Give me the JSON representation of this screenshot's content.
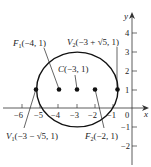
{
  "figure": {
    "axes": {
      "x_label": "x",
      "y_label": "y",
      "x_ticks": [
        "−6",
        "−5",
        "−4",
        "−3",
        "−2",
        "−1",
        "0"
      ],
      "y_ticks": [
        "4",
        "3",
        "2",
        "1",
        "−1",
        "−2"
      ]
    },
    "points": {
      "F1": {
        "name": "F",
        "sub": "1",
        "coords": "(−4, 1)"
      },
      "C": {
        "name": "C",
        "coords": "(−3, 1)"
      },
      "F2": {
        "name": "F",
        "sub": "2",
        "coords": "(−2, 1)"
      },
      "V1": {
        "name": "V",
        "sub": "1",
        "coords": "(−3 − √5, 1)"
      },
      "V2": {
        "name": "V",
        "sub": "2",
        "coords": "(−3 + √5, 1)"
      }
    },
    "ellipse": {
      "center": [
        -3,
        1
      ],
      "a": 2.236,
      "b": 2,
      "equation_hint": "(x+3)²/5 + (y−1)²/4 = 1"
    },
    "colors": {
      "stroke": "#111111",
      "text": "#222222",
      "background": "#ffffff"
    }
  }
}
